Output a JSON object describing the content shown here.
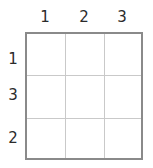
{
  "figure": {
    "type": "blank-grid",
    "rows": 3,
    "columns": 3,
    "background_color": "#ffffff"
  },
  "colors": {
    "outer_border": "#8a8a8a",
    "inner_gridline": "#c9c9c9",
    "label_text": "#2b2b2b"
  },
  "labels": {
    "columns": [
      {
        "id": "col-1",
        "text": "1"
      },
      {
        "id": "col-2",
        "text": "2"
      },
      {
        "id": "col-3",
        "text": "3"
      }
    ],
    "rows": [
      {
        "id": "row-1",
        "text": "1"
      },
      {
        "id": "row-2",
        "text": "3"
      },
      {
        "id": "row-3",
        "text": "2"
      }
    ]
  },
  "cells": [
    {
      "id": "cell-r1c1",
      "text": ""
    },
    {
      "id": "cell-r1c2",
      "text": ""
    },
    {
      "id": "cell-r1c3",
      "text": ""
    },
    {
      "id": "cell-r2c1",
      "text": ""
    },
    {
      "id": "cell-r2c2",
      "text": ""
    },
    {
      "id": "cell-r2c3",
      "text": ""
    },
    {
      "id": "cell-r3c1",
      "text": ""
    },
    {
      "id": "cell-r3c2",
      "text": ""
    },
    {
      "id": "cell-r3c3",
      "text": ""
    }
  ]
}
